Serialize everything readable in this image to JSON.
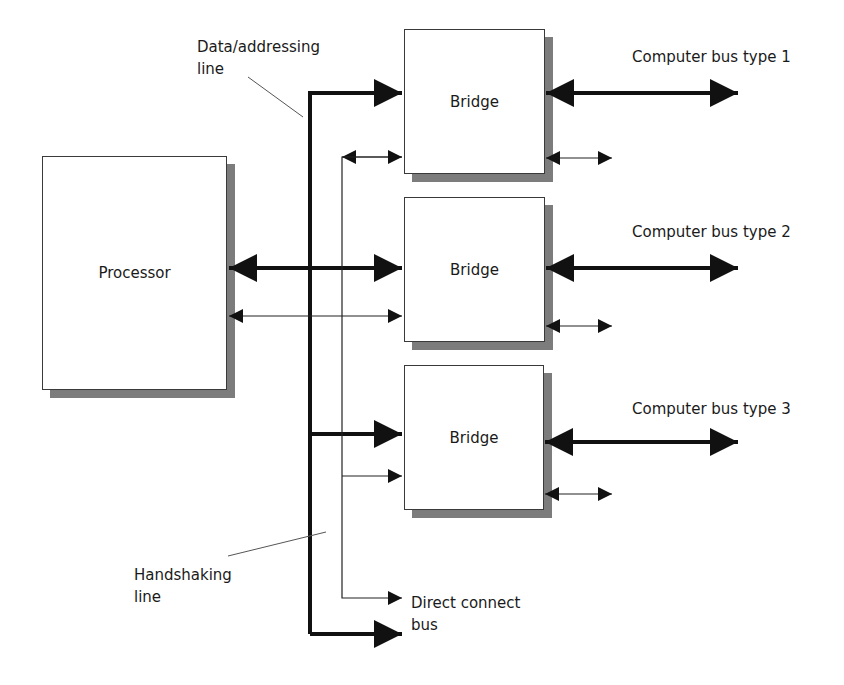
{
  "diagram": {
    "processor": {
      "label": "Processor"
    },
    "bridges": [
      {
        "label": "Bridge"
      },
      {
        "label": "Bridge"
      },
      {
        "label": "Bridge"
      }
    ],
    "bus_labels": [
      {
        "label": "Computer bus type 1"
      },
      {
        "label": "Computer bus type 2"
      },
      {
        "label": "Computer bus type 3"
      }
    ],
    "annotations": {
      "data_addressing_line": "Data/addressing\nline",
      "handshaking_line": "Handshaking\nline",
      "direct_connect_bus": "Direct connect\nbus"
    },
    "colors": {
      "line": "#111111",
      "box_border": "#3a3a3a",
      "shadow": "#7c7c7c",
      "leader": "#555555"
    }
  }
}
